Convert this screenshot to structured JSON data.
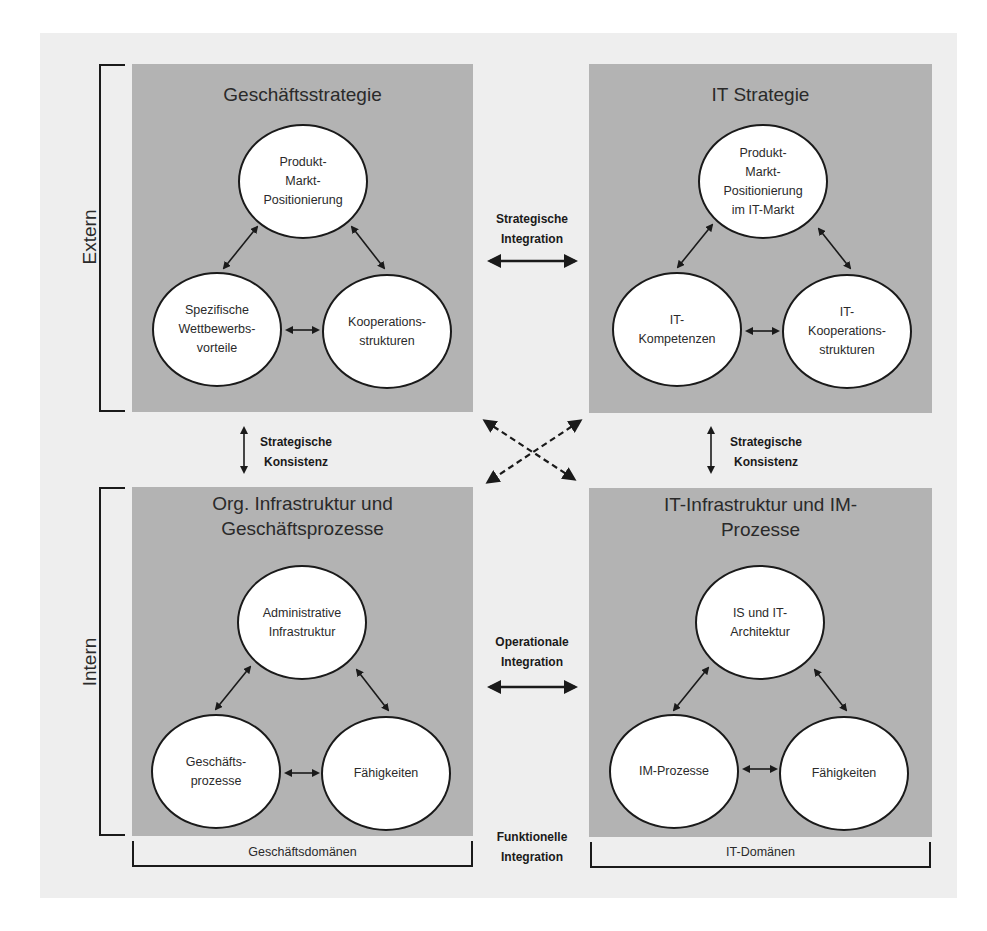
{
  "diagram": {
    "type": "strategic-alignment-model",
    "quadrants": {
      "top_left": {
        "title": "Geschäftsstrategie",
        "nodes": [
          "Produkt-\nMarkt-\nPositionierung",
          "Spezifische\nWettbewerbs-\nvorteile",
          "Kooperations-\nstrukturen"
        ]
      },
      "top_right": {
        "title": "IT Strategie",
        "nodes": [
          "Produkt-\nMarkt-\nPositionierung\nim IT-Markt",
          "IT-\nKompetenzen",
          "IT-\nKooperations-\nstrukturen"
        ]
      },
      "bottom_left": {
        "title": "Org. Infrastruktur und\nGeschäftsprozesse",
        "nodes": [
          "Administrative\nInfrastruktur",
          "Geschäfts-\nprozesse",
          "Fähigkeiten"
        ]
      },
      "bottom_right": {
        "title": "IT-Infrastruktur und IM-\nProzesse",
        "nodes": [
          "IS und IT-\nArchitektur",
          "IM-Prozesse",
          "Fähigkeiten"
        ]
      }
    },
    "side_labels": {
      "top": "Extern",
      "bottom": "Intern"
    },
    "relations": {
      "strategic_integration": "Strategische\nIntegration",
      "operational_integration": "Operationale\nIntegration",
      "strategic_consistency_left": "Strategische\nKonsistenz",
      "strategic_consistency_right": "Strategische\nKonsistenz",
      "functional_integration": "Funktionelle\nIntegration"
    },
    "domains": {
      "left": "Geschäftsdomänen",
      "right": "IT-Domänen"
    },
    "colors": {
      "background": "#eeeeee",
      "box": "#b3b3b3",
      "node_fill": "#ffffff",
      "line": "#1a1a1a"
    }
  }
}
